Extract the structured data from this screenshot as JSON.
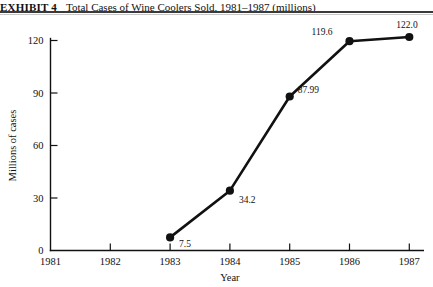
{
  "title": {
    "exhibit_label": "EXHIBIT 4",
    "caption": "Total Cases of Wine Coolers Sold, 1981–1987 (millions)"
  },
  "chart_data": {
    "type": "line",
    "title": "Total Cases of Wine Coolers Sold, 1981–1987 (millions)",
    "xlabel": "Year",
    "ylabel": "Millions of cases",
    "categories": [
      "1981",
      "1982",
      "1983",
      "1984",
      "1985",
      "1986",
      "1987"
    ],
    "x_tick_labels": [
      "1981",
      "1982",
      "1983",
      "1984",
      "1985",
      "1986",
      "1987"
    ],
    "y_tick_labels": [
      "0",
      "30",
      "60",
      "90",
      "120"
    ],
    "y_ticks": [
      0,
      30,
      60,
      90,
      120
    ],
    "ylim": [
      0,
      128
    ],
    "grid": false,
    "legend": "none",
    "marker": "filled-circle",
    "series": [
      {
        "name": "Total cases of wine coolers sold",
        "values": [
          null,
          null,
          7.5,
          34.2,
          87.99,
          119.6,
          122.0
        ]
      }
    ],
    "point_labels": [
      {
        "category": "1983",
        "value": 7.5,
        "text": "7.5",
        "dx": 9,
        "dy": 10
      },
      {
        "category": "1984",
        "value": 34.2,
        "text": "34.2",
        "dx": 9,
        "dy": 12
      },
      {
        "category": "1985",
        "value": 87.99,
        "text": "87.99",
        "dx": 8,
        "dy": -4
      },
      {
        "category": "1986",
        "value": 119.6,
        "text": "119.6",
        "dx": -38,
        "dy": -6
      },
      {
        "category": "1987",
        "value": 122.0,
        "text": "122.0",
        "dx": -13,
        "dy": -9
      }
    ]
  }
}
